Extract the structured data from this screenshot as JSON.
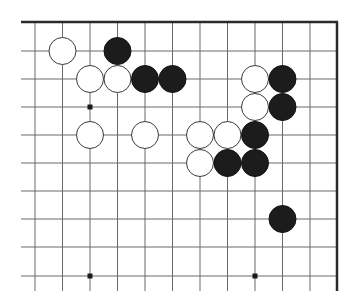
{
  "board": {
    "title": "Go board corner position",
    "grid": {
      "x_lines": [
        35,
        62.5,
        90,
        117.5,
        145,
        172.5,
        200,
        227.5,
        255,
        282.5,
        310
      ],
      "y_lines": [
        51,
        79,
        107,
        135,
        163,
        191,
        219,
        247,
        276
      ],
      "x_start": 21,
      "y_end": 291,
      "top_edge_y": 22,
      "right_edge_x": 337,
      "stone_radius": 13.5
    },
    "colors": {
      "background": "#ffffff",
      "grid": "#6a6a6a",
      "edge": "#2a2a2a",
      "black_stone": "#1c1c1c",
      "white_stone": "#ffffff"
    },
    "star_points": [
      {
        "col": 2,
        "row": 2
      },
      {
        "col": 2,
        "row": 8
      },
      {
        "col": 8,
        "row": 8
      }
    ],
    "stones": [
      {
        "color": "white",
        "col": 1,
        "row": 0
      },
      {
        "color": "black",
        "col": 3,
        "row": 0
      },
      {
        "color": "white",
        "col": 2,
        "row": 1
      },
      {
        "color": "white",
        "col": 3,
        "row": 1
      },
      {
        "color": "black",
        "col": 4,
        "row": 1
      },
      {
        "color": "black",
        "col": 5,
        "row": 1
      },
      {
        "color": "white",
        "col": 8,
        "row": 1
      },
      {
        "color": "black",
        "col": 9,
        "row": 1
      },
      {
        "color": "white",
        "col": 8,
        "row": 2
      },
      {
        "color": "black",
        "col": 9,
        "row": 2
      },
      {
        "color": "white",
        "col": 2,
        "row": 3
      },
      {
        "color": "white",
        "col": 4,
        "row": 3
      },
      {
        "color": "white",
        "col": 6,
        "row": 3
      },
      {
        "color": "white",
        "col": 7,
        "row": 3
      },
      {
        "color": "black",
        "col": 8,
        "row": 3
      },
      {
        "color": "white",
        "col": 6,
        "row": 4
      },
      {
        "color": "black",
        "col": 7,
        "row": 4
      },
      {
        "color": "black",
        "col": 8,
        "row": 4
      },
      {
        "color": "black",
        "col": 9,
        "row": 6
      }
    ]
  }
}
